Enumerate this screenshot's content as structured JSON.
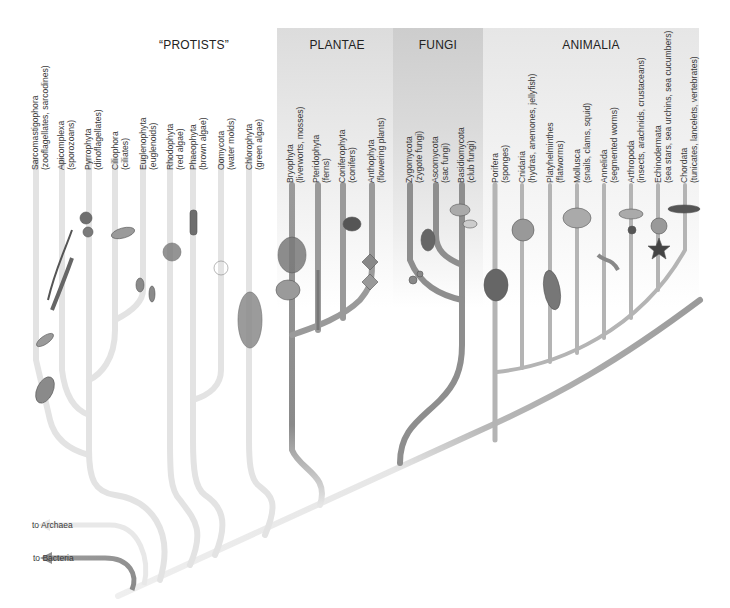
{
  "figure": {
    "kingdoms": [
      {
        "id": "protists",
        "label": "“PROTISTS”",
        "x": 194
      },
      {
        "id": "plantae",
        "label": "PLANTAE",
        "x": 337
      },
      {
        "id": "fungi",
        "label": "FUNGI",
        "x": 438
      },
      {
        "id": "animalia",
        "label": "ANIMALIA",
        "x": 591
      }
    ],
    "taxa": [
      {
        "kingdom": "protists",
        "name": "Sarcomastigophora",
        "common": "(zooflagellates, sarcodines)",
        "x": 34,
        "y": 160
      },
      {
        "kingdom": "protists",
        "name": "Apicomplexa",
        "common": "(sporozoans)",
        "x": 61,
        "y": 160
      },
      {
        "kingdom": "protists",
        "name": "Pyrrophyta",
        "common": "(dinoflagellates)",
        "x": 89,
        "y": 160
      },
      {
        "kingdom": "protists",
        "name": "Ciliophora",
        "common": "(ciliates)",
        "x": 115,
        "y": 160
      },
      {
        "kingdom": "protists",
        "name": "Euglenophyta",
        "common": "(euglenoids)",
        "x": 143,
        "y": 160
      },
      {
        "kingdom": "protists",
        "name": "Rhodophyta",
        "common": "(red algae)",
        "x": 170,
        "y": 160
      },
      {
        "kingdom": "protists",
        "name": "Phaeophyta",
        "common": "(brown algae)",
        "x": 193,
        "y": 160
      },
      {
        "kingdom": "protists",
        "name": "Oomycota",
        "common": "(water molds)",
        "x": 221,
        "y": 160
      },
      {
        "kingdom": "protists",
        "name": "Chlorophyta",
        "common": "(green algae)",
        "x": 249,
        "y": 160
      },
      {
        "kingdom": "plantae",
        "name": "Bryophyta",
        "common": "(liverworts, mosses)",
        "x": 290,
        "y": 180
      },
      {
        "kingdom": "plantae",
        "name": "Pteridophyta",
        "common": "(ferns)",
        "x": 316,
        "y": 180
      },
      {
        "kingdom": "plantae",
        "name": "Coniferophyta",
        "common": "(conifers)",
        "x": 341,
        "y": 180
      },
      {
        "kingdom": "plantae",
        "name": "Anthophyta",
        "common": "(flowering plants)",
        "x": 370,
        "y": 180
      },
      {
        "kingdom": "fungi",
        "name": "Zygomycota",
        "common": "(zygote fungi)",
        "x": 408,
        "y": 180
      },
      {
        "kingdom": "fungi",
        "name": "Ascomycota",
        "common": "(sac fungi)",
        "x": 434,
        "y": 180
      },
      {
        "kingdom": "fungi",
        "name": "Basidiomycota",
        "common": "(club fungi)",
        "x": 460,
        "y": 180
      },
      {
        "kingdom": "animalia",
        "name": "Porifera",
        "common": "(sponges)",
        "x": 494,
        "y": 180
      },
      {
        "kingdom": "animalia",
        "name": "Cnidaria",
        "common": "(hydras, anemones, jellyfish)",
        "x": 521,
        "y": 180
      },
      {
        "kingdom": "animalia",
        "name": "Platyhelminthes",
        "common": "(flatworms)",
        "x": 549,
        "y": 180
      },
      {
        "kingdom": "animalia",
        "name": "Mollusca",
        "common": "(snails, clams, squid)",
        "x": 576,
        "y": 180
      },
      {
        "kingdom": "animalia",
        "name": "Annelida",
        "common": "(segmented worms)",
        "x": 603,
        "y": 180
      },
      {
        "kingdom": "animalia",
        "name": "Arthropoda",
        "common": "(insects, arachnids, crustaceans)",
        "x": 630,
        "y": 180
      },
      {
        "kingdom": "animalia",
        "name": "Echinodermata",
        "common": "(sea stars, sea urchins, sea cucumbers)",
        "x": 657,
        "y": 180
      },
      {
        "kingdom": "animalia",
        "name": "Chordata",
        "common": "(tunicates, lancelets, vertebrates)",
        "x": 682,
        "y": 180
      }
    ],
    "outgroups": [
      {
        "label": "to Archaea",
        "x": 32,
        "y": 160
      },
      {
        "label": "to Bacteria",
        "x": 33,
        "y": 192
      }
    ],
    "colors": {
      "protist_branch": "#e2e2e2",
      "plant_branch": "#9a9a9a",
      "fungi_branch": "#8e8e8e",
      "animal_branch": "#b4b4b4",
      "archaea_arrow": "#e6e6e6",
      "bacteria_arrow": "#8f8f8f",
      "plantae_panel": "#dcdcdc",
      "fungi_panel": "#cdcdcd",
      "animalia_panel": "#e6e6e6"
    }
  }
}
